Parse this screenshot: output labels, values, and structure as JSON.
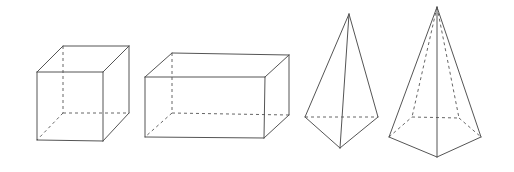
{
  "diagram": {
    "colors": {
      "background": "#ffffff",
      "edge": "#555555",
      "hidden_edge": "#666666"
    },
    "shapes": [
      {
        "id": "cube",
        "name": "Cube",
        "visible_edges": [
          [
            [
              37,
              72
            ],
            [
              103,
              72
            ]
          ],
          [
            [
              103,
              72
            ],
            [
              103,
              141
            ]
          ],
          [
            [
              103,
              141
            ],
            [
              37,
              140
            ]
          ],
          [
            [
              37,
              140
            ],
            [
              37,
              72
            ]
          ],
          [
            [
              37,
              72
            ],
            [
              63,
              46
            ]
          ],
          [
            [
              63,
              46
            ],
            [
              129,
              46
            ]
          ],
          [
            [
              103,
              72
            ],
            [
              129,
              46
            ]
          ],
          [
            [
              129,
              46
            ],
            [
              129,
              113
            ]
          ],
          [
            [
              103,
              141
            ],
            [
              129,
              113
            ]
          ]
        ],
        "hidden_edges": [
          [
            [
              63,
              46
            ],
            [
              63,
              113
            ]
          ],
          [
            [
              63,
              113
            ],
            [
              129,
              113
            ]
          ],
          [
            [
              63,
              113
            ],
            [
              37,
              140
            ]
          ]
        ]
      },
      {
        "id": "rectangular-prism",
        "name": "Rectangular prism",
        "visible_edges": [
          [
            [
              145,
              77
            ],
            [
              265,
              77
            ]
          ],
          [
            [
              265,
              77
            ],
            [
              264,
              138
            ]
          ],
          [
            [
              264,
              138
            ],
            [
              145,
              137
            ]
          ],
          [
            [
              145,
              137
            ],
            [
              145,
              77
            ]
          ],
          [
            [
              145,
              77
            ],
            [
              172,
              53
            ]
          ],
          [
            [
              172,
              53
            ],
            [
              289,
              55
            ]
          ],
          [
            [
              265,
              77
            ],
            [
              289,
              55
            ]
          ],
          [
            [
              289,
              55
            ],
            [
              289,
              115
            ]
          ],
          [
            [
              264,
              138
            ],
            [
              289,
              115
            ]
          ]
        ],
        "hidden_edges": [
          [
            [
              172,
              53
            ],
            [
              172,
              113
            ]
          ],
          [
            [
              172,
              113
            ],
            [
              289,
              115
            ]
          ],
          [
            [
              172,
              113
            ],
            [
              145,
              137
            ]
          ]
        ]
      },
      {
        "id": "triangular-pyramid",
        "name": "Triangular pyramid (tetrahedron)",
        "visible_edges": [
          [
            [
              349,
              14
            ],
            [
              305,
              117
            ]
          ],
          [
            [
              349,
              14
            ],
            [
              378,
              117
            ]
          ],
          [
            [
              349,
              14
            ],
            [
              340,
              148
            ]
          ],
          [
            [
              305,
              117
            ],
            [
              340,
              148
            ]
          ],
          [
            [
              378,
              117
            ],
            [
              340,
              148
            ]
          ]
        ],
        "hidden_edges": [
          [
            [
              305,
              117
            ],
            [
              378,
              117
            ]
          ]
        ]
      },
      {
        "id": "pentagonal-pyramid",
        "name": "Pentagonal pyramid",
        "visible_edges": [
          [
            [
              437,
              7
            ],
            [
              389,
              137
            ]
          ],
          [
            [
              437,
              7
            ],
            [
              481,
              137
            ]
          ],
          [
            [
              437,
              7
            ],
            [
              437,
              157
            ]
          ],
          [
            [
              389,
              137
            ],
            [
              437,
              157
            ]
          ],
          [
            [
              481,
              137
            ],
            [
              437,
              157
            ]
          ]
        ],
        "hidden_edges": [
          [
            [
              437,
              7
            ],
            [
              412,
              117
            ]
          ],
          [
            [
              437,
              7
            ],
            [
              459,
              118
            ]
          ],
          [
            [
              389,
              137
            ],
            [
              412,
              117
            ]
          ],
          [
            [
              412,
              117
            ],
            [
              459,
              118
            ]
          ],
          [
            [
              459,
              118
            ],
            [
              481,
              137
            ]
          ]
        ]
      }
    ]
  }
}
